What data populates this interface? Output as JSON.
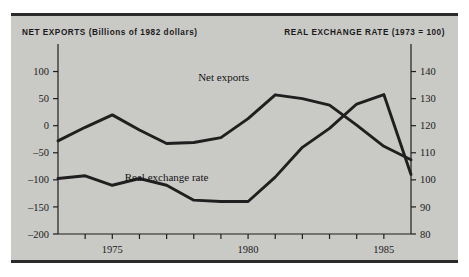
{
  "figure": {
    "background": "#ffffff",
    "panel_background": "#c9c9c6",
    "rule_color": "#2b2b2b",
    "ink_color": "#1f1f1f"
  },
  "headers": {
    "left": "NET EXPORTS (Billions of 1982 dollars)",
    "right": "REAL EXCHANGE RATE (1973 = 100)"
  },
  "chart_data": {
    "type": "line",
    "title": "",
    "xlabel": "",
    "grid": false,
    "legend_position": "inline-annotations",
    "xlim": [
      1973,
      1986
    ],
    "x_ticks": [
      1973,
      1974,
      1975,
      1976,
      1977,
      1978,
      1979,
      1980,
      1981,
      1982,
      1983,
      1984,
      1985,
      1986
    ],
    "x_tick_labels": [
      "",
      "",
      "1975",
      "",
      "",
      "",
      "",
      "1980",
      "",
      "",
      "",
      "",
      "1985",
      ""
    ],
    "axes": [
      {
        "id": "left",
        "ylabel": "NET EXPORTS (Billions of 1982 dollars)",
        "ylim": [
          -200,
          125
        ],
        "ticks": [
          100,
          50,
          0,
          -50,
          -100,
          -150,
          -200
        ],
        "tick_labels": [
          "100",
          "50",
          "0",
          "–50",
          "–100",
          "–150",
          "–200"
        ]
      },
      {
        "id": "right",
        "ylabel": "REAL EXCHANGE RATE (1973 = 100)",
        "ylim": [
          80,
          145
        ],
        "ticks": [
          140,
          130,
          120,
          110,
          100,
          90,
          80
        ],
        "tick_labels": [
          "140",
          "130",
          "120",
          "110",
          "100",
          "90",
          "80"
        ]
      }
    ],
    "series": [
      {
        "name": "Net exports",
        "axis": "left",
        "label": "Net exports",
        "label_x": 1979.1,
        "label_y": 82,
        "x": [
          1973,
          1974,
          1975,
          1976,
          1977,
          1978,
          1979,
          1980,
          1981,
          1982,
          1983,
          1984,
          1985,
          1986
        ],
        "values": [
          -28,
          -3,
          20,
          -8,
          -33,
          -31,
          -22,
          13,
          57,
          50,
          38,
          1,
          -38,
          -63
        ]
      },
      {
        "name": "Real exchange rate",
        "axis": "right",
        "label": "Real exchange rate",
        "label_x": 1977.0,
        "label_y": 99.5,
        "x": [
          1973,
          1974,
          1975,
          1976,
          1977,
          1978,
          1979,
          1980,
          1981,
          1982,
          1983,
          1984,
          1985,
          1986
        ],
        "values": [
          100.5,
          101.5,
          98,
          100.5,
          98,
          92.5,
          92,
          92,
          101,
          112,
          119,
          128,
          131.5,
          102
        ]
      }
    ]
  }
}
